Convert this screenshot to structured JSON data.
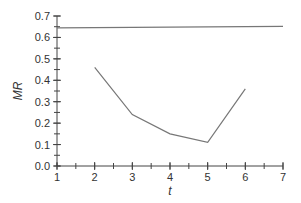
{
  "chart_data": {
    "type": "line",
    "title": "",
    "xlabel": "t",
    "ylabel": "MR",
    "xlim": [
      1,
      7
    ],
    "ylim": [
      0.0,
      0.7
    ],
    "x_ticks": [
      1,
      2,
      3,
      4,
      5,
      6,
      7
    ],
    "x_tick_labels": [
      "1",
      "2",
      "3",
      "4",
      "5",
      "6",
      "7"
    ],
    "x_minor_step": 0.5,
    "y_ticks": [
      0.0,
      0.1,
      0.2,
      0.3,
      0.4,
      0.5,
      0.6,
      0.7
    ],
    "y_tick_labels": [
      "0.0",
      "0.1",
      "0.2",
      "0.3",
      "0.4",
      "0.5",
      "0.6",
      "0.7"
    ],
    "y_minor_step": 0.05,
    "grid": false,
    "legend": null,
    "series": [
      {
        "name": "MR",
        "x": [
          2,
          3,
          4,
          5,
          6
        ],
        "values": [
          0.46,
          0.24,
          0.15,
          0.11,
          0.36
        ],
        "color": "#777777"
      },
      {
        "name": "reference line",
        "x": [
          1,
          7
        ],
        "values": [
          0.645,
          0.652
        ],
        "color": "#777777"
      }
    ]
  }
}
